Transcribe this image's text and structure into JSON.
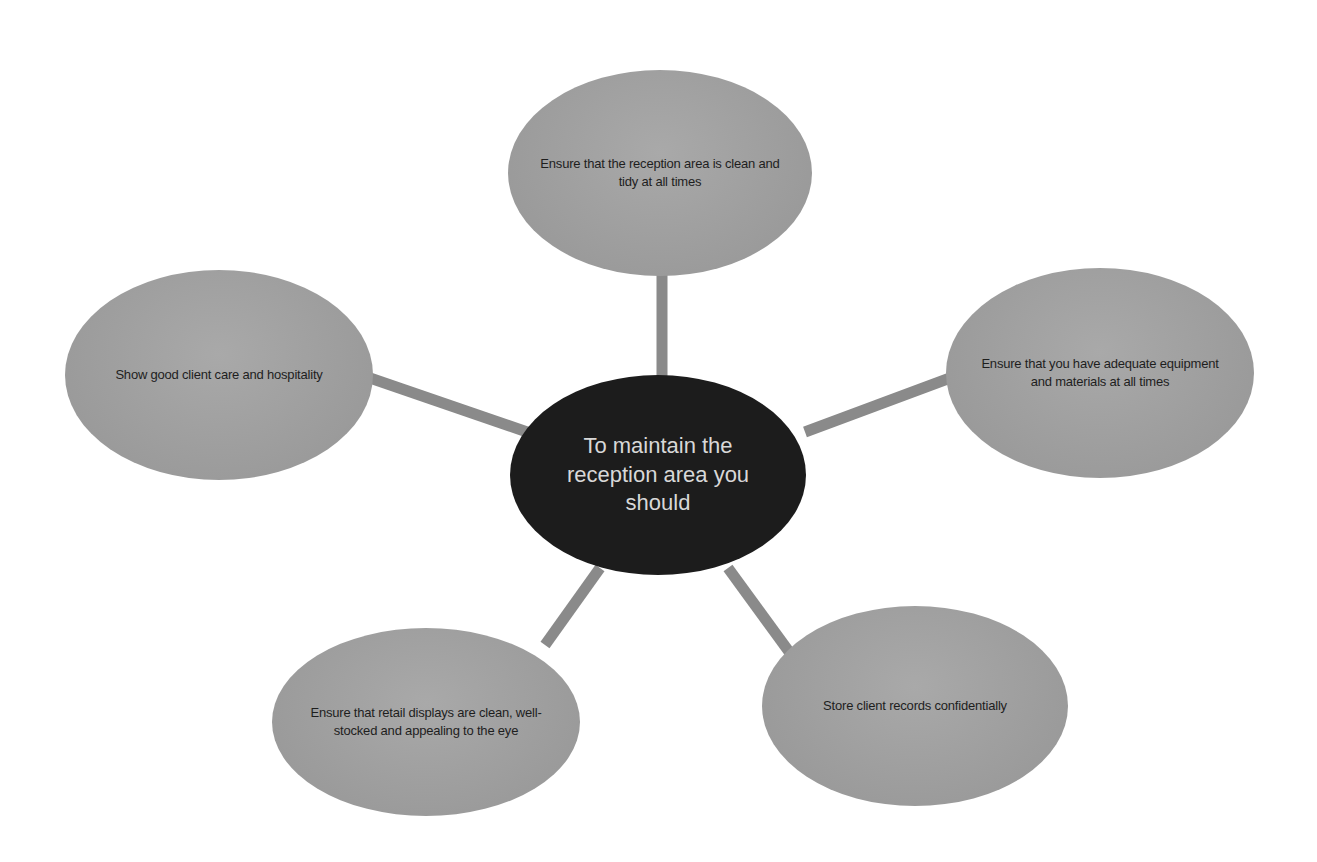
{
  "diagram": {
    "type": "spider-diagram",
    "colors": {
      "hub_fill": "#1c1c1c",
      "hub_text": "#d8d8d8",
      "leaf_fill": "#9f9f9f",
      "leaf_text": "#1e1e1e",
      "connector": "#8a8a8a",
      "background": "#ffffff"
    },
    "hub": {
      "label": "To maintain the reception area you should"
    },
    "nodes": [
      {
        "id": "top",
        "label": "Ensure that the reception area is clean and tidy at all times"
      },
      {
        "id": "left",
        "label": "Show good client care and hospitality"
      },
      {
        "id": "right",
        "label": "Ensure that you have adequate equipment and materials at all times"
      },
      {
        "id": "bottom-left",
        "label": "Ensure that retail displays are clean, well-stocked and appealing to the eye"
      },
      {
        "id": "bottom-right",
        "label": "Store client records confidentially"
      }
    ]
  }
}
